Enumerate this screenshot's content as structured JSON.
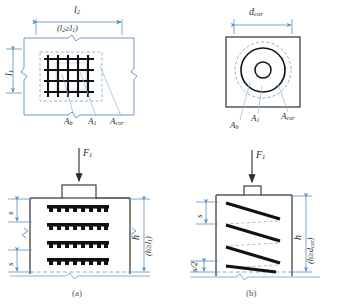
{
  "figure": {
    "colors": {
      "dimension_line": "#5b8fc9",
      "dashed_guide": "#7aa7d4",
      "outline": "#3f3f3f",
      "rebar": "#111111",
      "text": "#2b2b2b",
      "background": "#ffffff"
    }
  },
  "panel_a": {
    "caption": "(a)",
    "plan": {
      "dim_top": "l",
      "dim_top_sub": "2",
      "dim_top_note_pre": "(l",
      "dim_top_note_sub1": "2",
      "dim_top_note_mid": "≥l",
      "dim_top_note_sub2": "1",
      "dim_top_note_post": ")",
      "dim_left": "l",
      "dim_left_sub": "1",
      "leader_labels": [
        {
          "name": "A",
          "sub": "b"
        },
        {
          "name": "A",
          "sub": "1"
        },
        {
          "name": "A",
          "sub": "cor"
        }
      ],
      "mesh_rows": 4,
      "mesh_cols": 5
    },
    "elevation": {
      "load_label": "F",
      "load_label_sub": "1",
      "spacing_label_top": "s",
      "spacing_label_bottom": "s",
      "height_label": "h",
      "height_note_pre": "(h≥l",
      "height_note_sub": "1",
      "height_note_post": ")",
      "mesh_layers": 4
    }
  },
  "panel_b": {
    "caption": "(b)",
    "plan": {
      "dim_top": "d",
      "dim_top_sub": "cor",
      "leader_labels": [
        {
          "name": "A",
          "sub": "b"
        },
        {
          "name": "A",
          "sub": "1"
        },
        {
          "name": "A",
          "sub": "cor"
        }
      ]
    },
    "elevation": {
      "load_label": "F",
      "load_label_sub": "1",
      "spacing_label_top": "s",
      "spacing_label_bottom": "s/2",
      "height_label": "h",
      "height_note_pre": "(h≥d",
      "height_note_sub": "cor",
      "height_note_post": ")",
      "spiral_turns": 4
    }
  }
}
